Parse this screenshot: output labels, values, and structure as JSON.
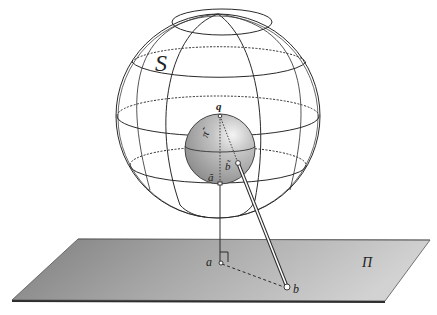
{
  "diagram": {
    "labels": {
      "sphere": "S",
      "plane": "Π",
      "point_q": "q",
      "point_a": "a",
      "point_b": "b",
      "inner_a": "ã",
      "inner_b": "b̃",
      "inner_pi": "π̃"
    },
    "colors": {
      "line": "#2a2a2a",
      "plane_fill_light": "#c8c8c8",
      "plane_fill_dark": "#8a8a8a",
      "plane_edge": "#3a3a3a",
      "inner_sphere_light": "#eeeeee",
      "inner_sphere_dark": "#8c8c8c"
    }
  }
}
